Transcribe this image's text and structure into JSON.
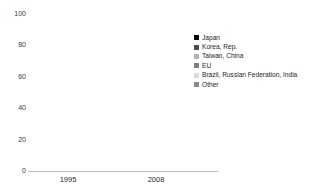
{
  "chart_data": {
    "type": "bar",
    "title": "",
    "subtitle": "",
    "xlabel": "",
    "ylabel": "",
    "stacked": true,
    "grid": false,
    "legend_position": "right",
    "ylim": [
      0,
      100
    ],
    "yticks": [
      0,
      20,
      40,
      60,
      80,
      100
    ],
    "ytick_labels": [
      "0",
      "20",
      "40",
      "60",
      "80",
      "100"
    ],
    "categories": [
      "1995",
      "2008"
    ],
    "series": [
      {
        "name": "Japan",
        "color": "#000000",
        "values": [
          27,
          16
        ]
      },
      {
        "name": "Korea, Rep.",
        "color": "#4d4d4d",
        "values": [
          9,
          8
        ]
      },
      {
        "name": "Taiwan, China",
        "color": "#b3b3b3",
        "values": [
          8,
          6
        ]
      },
      {
        "name": "EU",
        "color": "#7f7f7f",
        "values": [
          16,
          13
        ]
      },
      {
        "name": "Brazil, Russian Federation, India",
        "color": "#d9d9d9",
        "values": [
          2,
          4
        ]
      },
      {
        "name": "Other",
        "color": "#8c8c8c",
        "values": [
          38,
          53
        ]
      }
    ]
  },
  "axis": {
    "y_tick_labels": [
      "100",
      "80",
      "60",
      "40",
      "20",
      "0"
    ],
    "x_tick_labels": [
      "1995",
      "2008"
    ]
  },
  "legend": {
    "items": [
      {
        "label": "Japan"
      },
      {
        "label": "Korea, Rep."
      },
      {
        "label": "Taiwan, China"
      },
      {
        "label": "EU"
      },
      {
        "label": "Brazil, Russian Federation, India"
      },
      {
        "label": "Other"
      }
    ]
  }
}
